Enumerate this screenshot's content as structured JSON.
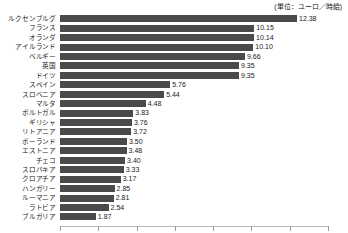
{
  "unit_note": "(単位：ユーロ／時給)",
  "chart_data": {
    "type": "bar",
    "orientation": "horizontal",
    "title": "",
    "subtitle": "",
    "xlabel": "",
    "ylabel": "",
    "unit_label": "(単位：ユーロ／時給)",
    "grid": false,
    "legend": "none",
    "xlim": [
      0,
      14
    ],
    "xticks": [
      0,
      2,
      4,
      6,
      8,
      10,
      12,
      14
    ],
    "xticklabels": [
      "",
      "",
      "",
      "",
      "",
      "",
      "",
      ""
    ],
    "bar_color": "#4a4a4a",
    "categories": [
      "ルクセンブルグ",
      "フランス",
      "オランダ",
      "アイルランド",
      "ベルギー",
      "英国",
      "ドイツ",
      "スペイン",
      "スロベニア",
      "マルタ",
      "ポルトガル",
      "ギリシャ",
      "リトアニア",
      "ポーランド",
      "エストニア",
      "チェコ",
      "スロバキア",
      "クロアチア",
      "ハンガリー",
      "ルーマニア",
      "ラトビア",
      "ブルガリア"
    ],
    "values": [
      12.38,
      10.15,
      10.14,
      10.1,
      9.66,
      9.35,
      9.35,
      5.76,
      5.44,
      4.48,
      3.83,
      3.76,
      3.72,
      3.5,
      3.48,
      3.4,
      3.33,
      3.17,
      2.85,
      2.81,
      2.54,
      1.87
    ],
    "value_labels": [
      "12.38",
      "10.15",
      "10.14",
      "10.10",
      "9.66",
      "9.35",
      "9.35",
      "5.76",
      "5.44",
      "4.48",
      "3.83",
      "3.76",
      "3.72",
      "3.50",
      "3.48",
      "3.40",
      "3.33",
      "3.17",
      "2.85",
      "2.81",
      "2.54",
      "1.87"
    ]
  }
}
